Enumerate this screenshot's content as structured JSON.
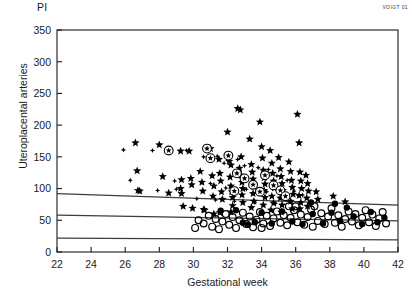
{
  "chart_data": {
    "type": "scatter",
    "title": "",
    "top_left_label": "PI",
    "ylabel": "Uteroplacental arteries",
    "xlabel": "Gestational week",
    "corner_tag": "VOIGT 01",
    "xlim": [
      22,
      42
    ],
    "ylim": [
      0,
      350
    ],
    "xticks": [
      22,
      24,
      26,
      28,
      30,
      32,
      34,
      36,
      38,
      40,
      42
    ],
    "yticks": [
      0,
      50,
      100,
      150,
      200,
      250,
      300,
      350
    ],
    "grid": false,
    "legend": "none",
    "colors": {
      "marker": "#000000",
      "axis": "#1a1a1a",
      "reference_line": "#3c3c3c"
    },
    "reference_lines": [
      {
        "name": "upper-percentile",
        "x": [
          22,
          42
        ],
        "y": [
          92,
          74
        ]
      },
      {
        "name": "middle-percentile",
        "x": [
          22,
          42
        ],
        "y": [
          58,
          49
        ]
      },
      {
        "name": "lower-percentile",
        "x": [
          22,
          42
        ],
        "y": [
          22,
          19
        ]
      }
    ],
    "series": [
      {
        "name": "star",
        "marker": "filled-star",
        "points": [
          [
            26.6,
            172
          ],
          [
            26.7,
            128
          ],
          [
            26.75,
            97
          ],
          [
            26.85,
            96
          ],
          [
            28.0,
            169
          ],
          [
            28.2,
            119
          ],
          [
            28.55,
            93
          ],
          [
            29.25,
            159
          ],
          [
            29.3,
            114
          ],
          [
            29.25,
            100
          ],
          [
            29.3,
            92
          ],
          [
            29.4,
            72
          ],
          [
            29.75,
            159
          ],
          [
            29.85,
            116
          ],
          [
            29.9,
            106
          ],
          [
            29.95,
            69
          ],
          [
            30.4,
            127
          ],
          [
            30.5,
            110
          ],
          [
            30.55,
            96
          ],
          [
            30.6,
            67
          ],
          [
            30.65,
            66
          ],
          [
            31.0,
            163
          ],
          [
            31.1,
            120
          ],
          [
            31.2,
            104
          ],
          [
            31.15,
            88
          ],
          [
            31.2,
            60
          ],
          [
            31.5,
            146
          ],
          [
            31.55,
            124
          ],
          [
            31.6,
            112
          ],
          [
            31.65,
            95
          ],
          [
            31.7,
            83
          ],
          [
            31.55,
            62
          ],
          [
            32.0,
            189
          ],
          [
            32.1,
            143
          ],
          [
            32.2,
            137
          ],
          [
            32.15,
            118
          ],
          [
            32.2,
            104
          ],
          [
            32.25,
            95
          ],
          [
            32.3,
            86
          ],
          [
            32.3,
            73
          ],
          [
            32.2,
            63
          ],
          [
            32.6,
            226
          ],
          [
            32.75,
            224
          ],
          [
            32.8,
            150
          ],
          [
            32.7,
            132
          ],
          [
            32.8,
            121
          ],
          [
            32.85,
            110
          ],
          [
            32.9,
            100
          ],
          [
            32.85,
            90
          ],
          [
            32.9,
            78
          ],
          [
            33.3,
            178
          ],
          [
            33.4,
            138
          ],
          [
            33.45,
            126
          ],
          [
            33.5,
            115
          ],
          [
            33.55,
            103
          ],
          [
            33.5,
            92
          ],
          [
            33.55,
            80
          ],
          [
            33.4,
            70
          ],
          [
            33.9,
            205
          ],
          [
            34.0,
            166
          ],
          [
            34.05,
            148
          ],
          [
            34.1,
            129
          ],
          [
            34.15,
            117
          ],
          [
            34.2,
            107
          ],
          [
            34.15,
            97
          ],
          [
            34.2,
            86
          ],
          [
            34.1,
            74
          ],
          [
            34.5,
            160
          ],
          [
            34.6,
            140
          ],
          [
            34.65,
            124
          ],
          [
            34.7,
            112
          ],
          [
            34.75,
            101
          ],
          [
            34.6,
            88
          ],
          [
            34.7,
            77
          ],
          [
            34.55,
            66
          ],
          [
            35.0,
            149
          ],
          [
            35.1,
            131
          ],
          [
            35.15,
            119
          ],
          [
            35.2,
            108
          ],
          [
            35.25,
            97
          ],
          [
            35.1,
            85
          ],
          [
            35.2,
            74
          ],
          [
            35.15,
            63
          ],
          [
            35.6,
            142
          ],
          [
            35.7,
            127
          ],
          [
            35.75,
            113
          ],
          [
            35.8,
            102
          ],
          [
            35.85,
            91
          ],
          [
            35.7,
            80
          ],
          [
            35.8,
            68
          ],
          [
            36.1,
            217
          ],
          [
            36.2,
            172
          ],
          [
            36.25,
            126
          ],
          [
            36.3,
            112
          ],
          [
            36.35,
            100
          ],
          [
            36.2,
            89
          ],
          [
            36.3,
            78
          ],
          [
            36.25,
            68
          ],
          [
            36.6,
            121
          ],
          [
            36.7,
            108
          ],
          [
            36.75,
            96
          ],
          [
            36.65,
            85
          ],
          [
            36.7,
            72
          ],
          [
            37.2,
            95
          ],
          [
            37.3,
            83
          ],
          [
            38.2,
            88
          ],
          [
            38.9,
            79
          ]
        ]
      },
      {
        "name": "small-diamond",
        "marker": "small-diamond",
        "points": [
          [
            25.9,
            161
          ],
          [
            27.6,
            160
          ],
          [
            28.55,
            160
          ],
          [
            29.6,
            160
          ],
          [
            26.3,
            113
          ],
          [
            28.9,
            112
          ],
          [
            30.6,
            150
          ],
          [
            31.4,
            151
          ],
          [
            31.8,
            140
          ],
          [
            32.6,
            146
          ],
          [
            33.0,
            136
          ],
          [
            33.8,
            133
          ],
          [
            34.4,
            130
          ],
          [
            34.9,
            120
          ],
          [
            35.5,
            113
          ],
          [
            31.0,
            108
          ],
          [
            31.9,
            101
          ],
          [
            33.1,
            99
          ],
          [
            34.3,
            95
          ],
          [
            30.2,
            84
          ],
          [
            31.3,
            82
          ],
          [
            32.4,
            80
          ],
          [
            33.6,
            78
          ],
          [
            34.8,
            76
          ],
          [
            35.9,
            96
          ],
          [
            36.4,
            90
          ],
          [
            29.0,
            99
          ],
          [
            27.9,
            97
          ]
        ]
      },
      {
        "name": "circled-star",
        "marker": "circled-star",
        "points": [
          [
            28.55,
            160
          ],
          [
            30.8,
            163
          ],
          [
            31.0,
            148
          ],
          [
            32.05,
            152
          ],
          [
            32.55,
            124
          ],
          [
            33.0,
            116
          ],
          [
            33.5,
            106
          ],
          [
            34.2,
            121
          ],
          [
            34.7,
            105
          ],
          [
            35.1,
            97
          ],
          [
            35.4,
            88
          ],
          [
            33.9,
            95
          ],
          [
            32.4,
            96
          ]
        ]
      },
      {
        "name": "open-circle",
        "marker": "open-circle",
        "points": [
          [
            30.6,
            45
          ],
          [
            30.9,
            57
          ],
          [
            31.1,
            40
          ],
          [
            31.3,
            52
          ],
          [
            31.5,
            36
          ],
          [
            31.7,
            48
          ],
          [
            31.9,
            60
          ],
          [
            32.1,
            43
          ],
          [
            32.3,
            55
          ],
          [
            32.5,
            38
          ],
          [
            32.7,
            50
          ],
          [
            32.9,
            62
          ],
          [
            33.1,
            44
          ],
          [
            33.3,
            56
          ],
          [
            33.5,
            39
          ],
          [
            33.7,
            51
          ],
          [
            33.9,
            63
          ],
          [
            34.1,
            45
          ],
          [
            34.3,
            57
          ],
          [
            34.5,
            41
          ],
          [
            34.7,
            53
          ],
          [
            34.9,
            64
          ],
          [
            35.1,
            46
          ],
          [
            35.3,
            58
          ],
          [
            35.5,
            42
          ],
          [
            35.7,
            54
          ],
          [
            35.9,
            66
          ],
          [
            36.1,
            47
          ],
          [
            36.3,
            59
          ],
          [
            36.5,
            43
          ],
          [
            36.7,
            55
          ],
          [
            36.9,
            67
          ],
          [
            37.1,
            72
          ],
          [
            37.3,
            49
          ],
          [
            37.5,
            61
          ],
          [
            37.7,
            44
          ],
          [
            37.9,
            56
          ],
          [
            38.1,
            69
          ],
          [
            38.3,
            46
          ],
          [
            38.5,
            58
          ],
          [
            38.7,
            40
          ],
          [
            38.9,
            52
          ],
          [
            39.1,
            64
          ],
          [
            39.3,
            48
          ],
          [
            39.5,
            60
          ],
          [
            39.7,
            42
          ],
          [
            39.9,
            54
          ],
          [
            40.1,
            66
          ],
          [
            40.3,
            47
          ],
          [
            40.5,
            59
          ],
          [
            40.7,
            41
          ],
          [
            40.9,
            53
          ],
          [
            41.1,
            63
          ],
          [
            41.3,
            45
          ],
          [
            30.3,
            50
          ],
          [
            30.1,
            38
          ],
          [
            36.0,
            72
          ],
          [
            37.0,
            40
          ],
          [
            35.6,
            72
          ],
          [
            34.0,
            38
          ]
        ]
      },
      {
        "name": "filled-circle",
        "marker": "filled-circle",
        "points": [
          [
            31.6,
            65
          ],
          [
            32.5,
            66
          ],
          [
            33.2,
            43
          ],
          [
            34.0,
            62
          ],
          [
            34.6,
            45
          ],
          [
            35.2,
            64
          ],
          [
            35.8,
            48
          ],
          [
            36.4,
            44
          ],
          [
            37.0,
            60
          ],
          [
            37.6,
            45
          ],
          [
            38.1,
            62
          ],
          [
            38.6,
            49
          ],
          [
            39.0,
            70
          ],
          [
            39.4,
            56
          ],
          [
            39.9,
            44
          ],
          [
            40.4,
            63
          ],
          [
            40.8,
            47
          ],
          [
            41.2,
            54
          ],
          [
            36.9,
            78
          ],
          [
            38.3,
            76
          ],
          [
            33.6,
            47
          ],
          [
            32.9,
            46
          ]
        ]
      }
    ]
  }
}
